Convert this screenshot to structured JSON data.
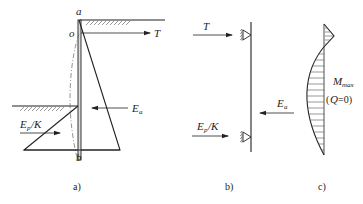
{
  "figure_a": {
    "caption": "a)",
    "point_top": "a",
    "point_anchor": "o",
    "point_bottom": "b",
    "anchor_force": "T",
    "active_force": "E",
    "active_force_sub": "a",
    "passive_force": "E",
    "passive_force_sub": "p",
    "passive_force_suffix": "/K"
  },
  "figure_b": {
    "caption": "b)",
    "anchor_force": "T",
    "active_force": "E",
    "active_force_sub": "a",
    "passive_force": "E",
    "passive_force_sub": "p",
    "passive_force_suffix": "/K"
  },
  "figure_c": {
    "caption": "c)",
    "moment_label": "M",
    "moment_sub": "max",
    "condition_open": "(",
    "condition_var": "Q",
    "condition_rest": "=0)"
  }
}
